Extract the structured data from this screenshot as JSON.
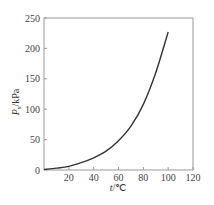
{
  "chart_data": {
    "type": "line",
    "title": "",
    "xlabel_var": "t",
    "xlabel_unit": "/℃",
    "ylabel_var": "P",
    "ylabel_sub": "s",
    "ylabel_unit": "/kPa",
    "xlim": [
      0,
      120
    ],
    "ylim": [
      0,
      250
    ],
    "xticks": [
      20,
      40,
      60,
      80,
      100,
      120
    ],
    "xtick_labels": [
      "20",
      "40",
      "60",
      "80",
      "100",
      "120"
    ],
    "yticks": [
      0,
      50,
      100,
      150,
      200,
      250
    ],
    "ytick_labels": [
      "0",
      "50",
      "100",
      "150",
      "200",
      "250"
    ],
    "grid": false,
    "legend": "none",
    "series": [
      {
        "name": "vapor pressure",
        "x": [
          0,
          10,
          20,
          30,
          40,
          50,
          60,
          70,
          80,
          90,
          100
        ],
        "y": [
          1,
          3,
          6,
          12,
          20,
          31,
          48,
          72,
          108,
          160,
          227
        ]
      }
    ]
  }
}
